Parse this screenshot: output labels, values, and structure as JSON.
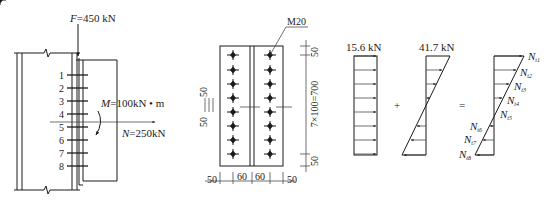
{
  "figure": {
    "panel_a": {
      "force_label": "F=450 kN",
      "force_var": "F",
      "force_val": "=450 kN",
      "moment_var": "M",
      "moment_val": "=100kN • m",
      "axial_var": "N",
      "axial_val": "=250kN",
      "bolt_row_numbers": [
        "1",
        "2",
        "3",
        "4",
        "5",
        "6",
        "7",
        "8"
      ]
    },
    "panel_b": {
      "bolt_label": "M20",
      "dim_top": "50",
      "dim_bottom": "50",
      "dim_vertical": "7×100=700",
      "dim_left_a": "50",
      "dim_left_b": "50",
      "dim_h": [
        "50",
        "60",
        "60",
        "50"
      ]
    },
    "panel_c": {
      "uniform_label": "15.6 kN",
      "linear_label": "41.7 kN",
      "plus": "+",
      "equals": "=",
      "result_labels": [
        {
          "base": "N",
          "sub": "t1"
        },
        {
          "base": "N",
          "sub": "t2"
        },
        {
          "base": "N",
          "sub": "t3"
        },
        {
          "base": "N",
          "sub": "t4"
        },
        {
          "base": "N",
          "sub": "t5"
        },
        {
          "base": "N",
          "sub": "t6"
        },
        {
          "base": "N",
          "sub": "t7"
        },
        {
          "base": "N",
          "sub": "t8"
        }
      ]
    }
  }
}
